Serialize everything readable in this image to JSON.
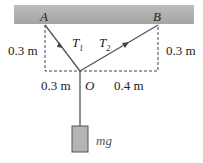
{
  "diagram": {
    "points": {
      "A": "A",
      "B": "B",
      "O": "O"
    },
    "tensions": {
      "t1": "T",
      "t1_sub": "1",
      "t2": "T",
      "t2_sub": "2"
    },
    "dimensions": {
      "left_height": "0.3 m",
      "right_height": "0.3 m",
      "left_width": "0.3 m",
      "right_width": "0.4 m"
    },
    "weight": "mg",
    "colors": {
      "ceiling": "#a9a9a9",
      "block": "#b5b5b5",
      "line": "#555555"
    }
  }
}
